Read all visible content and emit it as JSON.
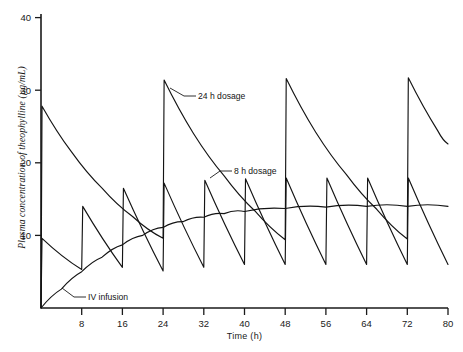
{
  "chart_data": {
    "type": "line",
    "title": "",
    "xlabel": "Time (h)",
    "ylabel": "Plasma concentration of theophylline (µg/mL)",
    "xlim": [
      0,
      80
    ],
    "ylim": [
      0,
      40
    ],
    "grid": false,
    "legend_position": "inline-annotations",
    "x_ticks": [
      8,
      16,
      24,
      32,
      40,
      48,
      56,
      64,
      72,
      80
    ],
    "y_ticks": [
      10,
      20,
      30,
      40
    ],
    "series": [
      {
        "name": "24 h dosage",
        "annotation": "24 h dosage",
        "dose_interval_h": 24,
        "description": "Large bolus dose every 24 h giving wide peak-trough swings",
        "points": [
          {
            "t": 0,
            "c": 0
          },
          {
            "t": 0.2,
            "c": 27.8
          },
          {
            "t": 6,
            "c": 21.5
          },
          {
            "t": 12,
            "c": 16.5
          },
          {
            "t": 18,
            "c": 12.6
          },
          {
            "t": 24,
            "c": 9.6
          },
          {
            "t": 24.2,
            "c": 31.4
          },
          {
            "t": 30,
            "c": 24.0
          },
          {
            "t": 36,
            "c": 18.2
          },
          {
            "t": 42,
            "c": 13.4
          },
          {
            "t": 48,
            "c": 9.4
          },
          {
            "t": 48.2,
            "c": 31.6
          },
          {
            "t": 54,
            "c": 24.2
          },
          {
            "t": 60,
            "c": 18.4
          },
          {
            "t": 66,
            "c": 13.6
          },
          {
            "t": 72,
            "c": 9.5
          },
          {
            "t": 72.2,
            "c": 31.7
          },
          {
            "t": 78,
            "c": 24.4
          },
          {
            "t": 80,
            "c": 22.6
          }
        ]
      },
      {
        "name": "8 h dosage",
        "annotation": "8 h dosage",
        "dose_interval_h": 8,
        "description": "Smaller dose every 8 h giving narrow sawtooth oscillation near 6-18 µg/mL",
        "points": [
          {
            "t": 0,
            "c": 0
          },
          {
            "t": 0.2,
            "c": 9.6
          },
          {
            "t": 8,
            "c": 5.3
          },
          {
            "t": 8.2,
            "c": 14.0
          },
          {
            "t": 16,
            "c": 5.6
          },
          {
            "t": 16.2,
            "c": 16.5
          },
          {
            "t": 24,
            "c": 5.1
          },
          {
            "t": 24.2,
            "c": 17.2
          },
          {
            "t": 32,
            "c": 5.6
          },
          {
            "t": 32.2,
            "c": 17.6
          },
          {
            "t": 40,
            "c": 6.0
          },
          {
            "t": 40.2,
            "c": 17.8
          },
          {
            "t": 48,
            "c": 6.0
          },
          {
            "t": 48.2,
            "c": 17.9
          },
          {
            "t": 56,
            "c": 6.0
          },
          {
            "t": 56.2,
            "c": 17.9
          },
          {
            "t": 64,
            "c": 6.0
          },
          {
            "t": 64.2,
            "c": 17.9
          },
          {
            "t": 72,
            "c": 6.0
          },
          {
            "t": 72.2,
            "c": 17.9
          },
          {
            "t": 80,
            "c": 6.0
          }
        ]
      },
      {
        "name": "IV infusion",
        "annotation": "IV infusion",
        "description": "Continuous intravenous infusion rising asymptotically to a steady-state plateau near 14 µg/mL",
        "points": [
          {
            "t": 0,
            "c": 0
          },
          {
            "t": 4,
            "c": 2.6
          },
          {
            "t": 8,
            "c": 5.0
          },
          {
            "t": 12,
            "c": 7.0
          },
          {
            "t": 16,
            "c": 8.7
          },
          {
            "t": 20,
            "c": 10.0
          },
          {
            "t": 24,
            "c": 11.1
          },
          {
            "t": 28,
            "c": 11.9
          },
          {
            "t": 32,
            "c": 12.5
          },
          {
            "t": 36,
            "c": 13.0
          },
          {
            "t": 40,
            "c": 13.3
          },
          {
            "t": 48,
            "c": 13.7
          },
          {
            "t": 56,
            "c": 13.9
          },
          {
            "t": 64,
            "c": 14.0
          },
          {
            "t": 72,
            "c": 14.0
          },
          {
            "t": 80,
            "c": 14.0
          }
        ]
      }
    ],
    "annotations": [
      {
        "label": "24 h dosage",
        "x_h": 27.5,
        "y_c": 28.6
      },
      {
        "label": "8 h dosage",
        "x_h": 33.5,
        "y_c": 18.9
      },
      {
        "label": "IV infusion",
        "x_h": 8.5,
        "y_c": 2.6
      }
    ]
  },
  "axes": {
    "y_title": "Plasma concentration of theophylline (µg/mL)",
    "x_title": "Time (h)",
    "y_tick_labels": [
      "40",
      "30",
      "20",
      "10"
    ],
    "x_tick_labels": [
      "8",
      "16",
      "24",
      "32",
      "40",
      "48",
      "56",
      "64",
      "72",
      "80"
    ]
  },
  "colors": {
    "ink": "#141414",
    "axis": "#1a1a1a",
    "background": "#ffffff"
  },
  "caption": {
    "text": ""
  }
}
